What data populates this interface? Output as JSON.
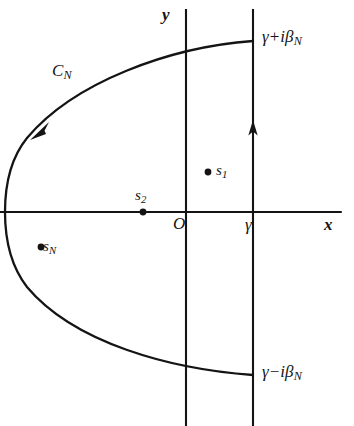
{
  "figure": {
    "width": 354,
    "height": 426,
    "background": "#ffffff",
    "ink_color": "#141414"
  },
  "axes": {
    "x_axis_label": "x",
    "y_axis_label": "y",
    "origin_label": "O",
    "x_axis": {
      "x1": 0,
      "y1": 212,
      "x2": 341,
      "y2": 212
    },
    "y_axis": {
      "x1": 186,
      "y1": 9,
      "x2": 186,
      "y2": 426
    }
  },
  "vertical_line": {
    "name": "bromwich-line",
    "tick_label": "γ",
    "x": 253,
    "y_top": 9,
    "y_bottom": 426,
    "arrow_direction": "up",
    "arrow_y": 130
  },
  "contour": {
    "label": "C_N",
    "label_base": "C",
    "label_sub": "N",
    "direction": "counterclockwise",
    "arrow_position": {
      "x": 41,
      "y": 128
    },
    "vertex": {
      "x": 5,
      "y": 212
    },
    "top_endpoint": {
      "x": 253,
      "y": 41
    },
    "bottom_endpoint": {
      "x": 253,
      "y": 375
    }
  },
  "endpoint_labels": {
    "top": {
      "base": "γ",
      "operator": "+",
      "imag": "i",
      "symbol": "β",
      "sub": "N"
    },
    "bottom": {
      "base": "γ",
      "operator": "−",
      "imag": "i",
      "symbol": "β",
      "sub": "N"
    }
  },
  "poles": [
    {
      "id": "s1",
      "base": "s",
      "sub": "1",
      "dot": {
        "x": 208,
        "y": 172
      },
      "label_side": "right"
    },
    {
      "id": "s2",
      "base": "s",
      "sub": "2",
      "dot": {
        "x": 143,
        "y": 212
      },
      "label_side": "above"
    },
    {
      "id": "sN",
      "base": "s",
      "sub": "N",
      "dot": {
        "x": 41,
        "y": 247
      },
      "label_side": "right"
    }
  ]
}
